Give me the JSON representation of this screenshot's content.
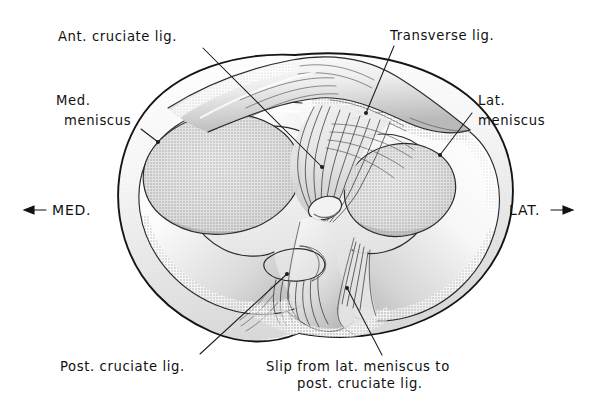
{
  "figure": {
    "background_color": "#ffffff",
    "ink_color": "#111111",
    "width": 594,
    "height": 405
  },
  "labels": {
    "ant_cruciate": {
      "text": "Ant. cruciate lig.",
      "x": 58,
      "y": 41,
      "anchor": "start",
      "leader_from": [
        203,
        48
      ],
      "leader_to": [
        322,
        167
      ]
    },
    "transverse": {
      "text": "Transverse lig.",
      "x": 390,
      "y": 40,
      "anchor": "start",
      "leader_from": [
        394,
        46
      ],
      "leader_to": [
        366,
        113
      ]
    },
    "med_meniscus_line1": {
      "text": "Med.",
      "x": 56,
      "y": 105,
      "anchor": "start"
    },
    "med_meniscus_line2": {
      "text": "meniscus",
      "x": 64,
      "y": 125,
      "anchor": "start",
      "leader_from": [
        141,
        129
      ],
      "leader_to": [
        158,
        142
      ]
    },
    "lat_meniscus_line1": {
      "text": "Lat.",
      "x": 478,
      "y": 105,
      "anchor": "start"
    },
    "lat_meniscus_line2": {
      "text": "meniscus",
      "x": 478,
      "y": 125,
      "anchor": "start",
      "leader_from": [
        472,
        113
      ],
      "leader_to": [
        440,
        155
      ]
    },
    "med_direction": {
      "text": "MED.",
      "x": 52,
      "y": 215,
      "anchor": "start",
      "arrow": "left-arrow",
      "arrow_x1": 46,
      "arrow_x2": 24,
      "arrow_y": 210
    },
    "lat_direction": {
      "text": "LAT.",
      "x": 509,
      "y": 215,
      "anchor": "start",
      "arrow": "right-arrow",
      "arrow_x1": 551,
      "arrow_x2": 574,
      "arrow_y": 210
    },
    "post_cruciate": {
      "text": "Post. cruciate lig.",
      "x": 60,
      "y": 371,
      "anchor": "start",
      "leader_from": [
        200,
        354
      ],
      "leader_to": [
        287,
        274
      ]
    },
    "slip_line1": {
      "text": "Slip from lat. meniscus to",
      "x": 266,
      "y": 371,
      "anchor": "start"
    },
    "slip_line2": {
      "text": "post. cruciate lig.",
      "x": 297,
      "y": 388,
      "anchor": "start",
      "leader_from": [
        382,
        355
      ],
      "leader_to": [
        347,
        288
      ]
    }
  },
  "structures": [
    {
      "name": "medial-meniscus",
      "side": "medial",
      "description": "C-shaped medial meniscus, broad posterior horn"
    },
    {
      "name": "lateral-meniscus",
      "side": "lateral",
      "description": "More circular lateral meniscus"
    },
    {
      "name": "anterior-cruciate-ligament",
      "description": "Fan of fibers attaching to anterior intercondylar area"
    },
    {
      "name": "posterior-cruciate-ligament",
      "description": "Fibers running to posterior intercondylar area"
    },
    {
      "name": "transverse-ligament",
      "description": "Band joining anterior horns of both menisci"
    },
    {
      "name": "slip-from-lateral-meniscus",
      "description": "Meniscofemoral slip to posterior cruciate ligament"
    },
    {
      "name": "medial-articular-surface",
      "description": "Oval concave medial tibial condyle surface"
    },
    {
      "name": "lateral-articular-surface",
      "description": "Oval lateral tibial condyle surface"
    },
    {
      "name": "intercondylar-eminence",
      "description": "Central tibial spine tubercle"
    }
  ]
}
